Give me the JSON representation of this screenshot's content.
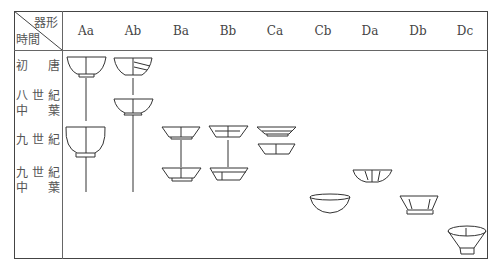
{
  "table": {
    "corner": {
      "top_right": "器形",
      "bottom_left": "時間"
    },
    "columns": [
      {
        "label": "Aa",
        "x": 86
      },
      {
        "label": "Ab",
        "x": 133
      },
      {
        "label": "Ba",
        "x": 181
      },
      {
        "label": "Bb",
        "x": 228
      },
      {
        "label": "Ca",
        "x": 275
      },
      {
        "label": "Cb",
        "x": 323
      },
      {
        "label": "Da",
        "x": 370
      },
      {
        "label": "Db",
        "x": 418
      },
      {
        "label": "Dc",
        "x": 465
      }
    ],
    "rows": [
      {
        "line1": "初　唐",
        "line2": ""
      },
      {
        "line1": "八世紀",
        "line2": "中　葉"
      },
      {
        "line1": "九世紀",
        "line2": ""
      },
      {
        "line1": "九世紀",
        "line2": "中　葉"
      }
    ],
    "vessels": [
      {
        "type": "Aa",
        "period": "初唐",
        "shape": "deep bowl with foot"
      },
      {
        "type": "Aa",
        "period": "九世紀",
        "shape": "deep rounded bowl with foot"
      },
      {
        "type": "Ab",
        "period": "初唐",
        "shape": "bowl, restored"
      },
      {
        "type": "Ab",
        "period": "八世紀中葉",
        "shape": "shallow bowl"
      },
      {
        "type": "Ba",
        "period": "九世紀",
        "shape": "flared bowl"
      },
      {
        "type": "Ba",
        "period": "九世紀中葉",
        "shape": "flared bowl, restored"
      },
      {
        "type": "Bb",
        "period": "九世紀",
        "shape": "flared bowl"
      },
      {
        "type": "Bb",
        "period": "九世紀中葉",
        "shape": "flared bowl, restored"
      },
      {
        "type": "Ca",
        "period": "九世紀",
        "shape": "two shallow bowls"
      },
      {
        "type": "Cb",
        "period": "late",
        "shape": "wide shallow bowl"
      },
      {
        "type": "Da",
        "period": "九世紀中葉",
        "shape": "lobed bowl"
      },
      {
        "type": "Db",
        "period": "late",
        "shape": "lobed bowl with high foot"
      },
      {
        "type": "Dc",
        "period": "latest",
        "shape": "flaring lobed bowl with high foot"
      }
    ]
  }
}
